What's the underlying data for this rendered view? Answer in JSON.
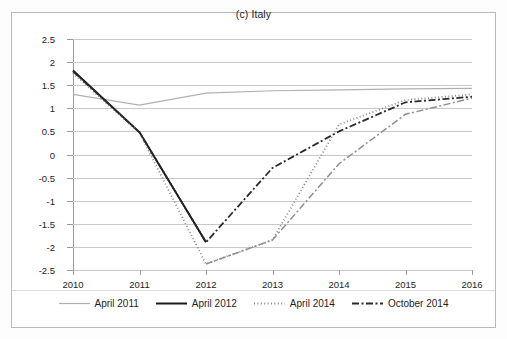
{
  "figure": {
    "title": "(c) Italy"
  },
  "legend": {
    "items": [
      {
        "label": "April 2011",
        "style": "solid-light",
        "color": "#b0b0b0"
      },
      {
        "label": "April 2012",
        "style": "solid-black",
        "color": "#1a1a1a"
      },
      {
        "label": "April 2014",
        "style": "dotted",
        "color": "#8a8a8a"
      },
      {
        "label": "October 2014",
        "style": "dash-dot",
        "color": "#2a2a2a"
      }
    ]
  },
  "chart_data": {
    "type": "line",
    "title": "(c) Italy",
    "xlabel": "",
    "ylabel": "",
    "x": [
      2010,
      2011,
      2012,
      2013,
      2014,
      2015,
      2016
    ],
    "categories": [
      "2010",
      "2011",
      "2012",
      "2013",
      "2014",
      "2015",
      "2016"
    ],
    "xlim": [
      2010,
      2016
    ],
    "ylim": [
      -2.5,
      2.5
    ],
    "yticks": [
      2.5,
      2,
      1.5,
      1,
      0.5,
      0,
      -0.5,
      -1,
      -1.5,
      -2,
      -2.5
    ],
    "ytick_labels": [
      "2.5",
      "2",
      "1.5",
      "1",
      "0.5",
      "0",
      "-0.5",
      "-1",
      "-1.5",
      "-2",
      "-2.5"
    ],
    "grid": true,
    "legend_position": "bottom",
    "series": [
      {
        "name": "April 2011",
        "style": "solid-light",
        "color": "#b0b0b0",
        "x": [
          2010,
          2011,
          2012,
          2013,
          2014,
          2015,
          2016
        ],
        "values": [
          1.3,
          1.07,
          1.33,
          1.38,
          1.4,
          1.42,
          1.43
        ]
      },
      {
        "name": "April 2012",
        "style": "solid-black",
        "color": "#1a1a1a",
        "x": [
          2010,
          2011,
          2012
        ],
        "values": [
          1.82,
          0.48,
          -1.9
        ]
      },
      {
        "name": "April 2014",
        "style": "dotted",
        "color": "#8a8a8a",
        "x": [
          2010,
          2011,
          2012,
          2013,
          2014,
          2015,
          2016
        ],
        "values": [
          1.76,
          0.47,
          -2.37,
          -1.85,
          0.65,
          1.18,
          1.3
        ]
      },
      {
        "name": "October 2014",
        "style": "dash-dot",
        "color": "#2a2a2a",
        "x": [
          2010,
          2011,
          2012,
          2013,
          2014,
          2015,
          2016
        ],
        "values": [
          1.8,
          0.48,
          -1.9,
          -0.29,
          0.5,
          1.13,
          1.25
        ]
      },
      {
        "name": "October 2014 lower branch",
        "style": "dash-dot-light",
        "color": "#8f8f8f",
        "x": [
          2012,
          2013,
          2014,
          2015,
          2016
        ],
        "values": [
          -2.37,
          -1.85,
          -0.2,
          0.87,
          1.22
        ]
      }
    ]
  }
}
